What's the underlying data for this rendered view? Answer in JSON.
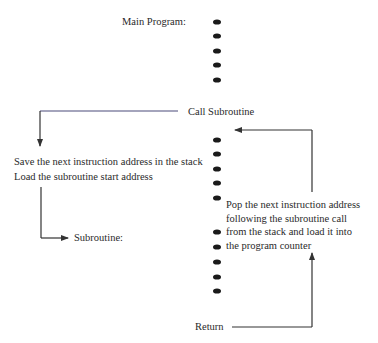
{
  "diagram": {
    "type": "subroutine-call-flow",
    "main_program_label": "Main Program:",
    "call_label": "Call Subroutine",
    "save_step": {
      "line1": "Save the next instruction address in the stack",
      "line2": "Load the subroutine start address"
    },
    "subroutine_label": "Subroutine:",
    "pop_step": {
      "line1": "Pop the next instruction address",
      "line2": "following the subroutine call",
      "line3": "from the stack and load it into",
      "line4": "the program counter"
    },
    "return_label": "Return",
    "dots": {
      "x": 217,
      "main_program_y": [
        22,
        36,
        51,
        65,
        80
      ],
      "subroutine_y": [
        140,
        154,
        169,
        183,
        198,
        232,
        247,
        262,
        277,
        291
      ]
    },
    "colors": {
      "text": "#2a2a2a",
      "line": "#3a3a3a",
      "call_line": "#4a4a7a",
      "dot": "#1a1a1a"
    }
  }
}
